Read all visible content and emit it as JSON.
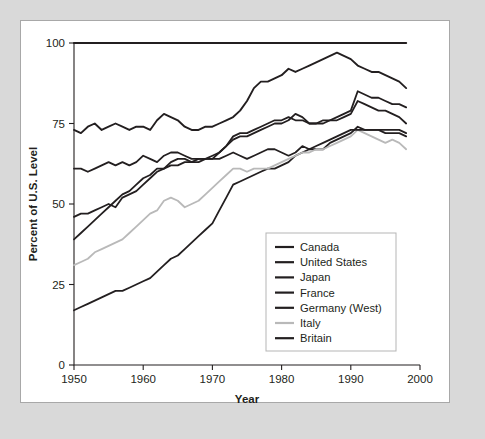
{
  "figure": {
    "background_color": "#d9d9d9",
    "card_color": "#ffffff",
    "card_border_color": "#a8a8a8"
  },
  "chart_data": {
    "type": "line",
    "title": "",
    "xlabel": "Year",
    "ylabel": "Percent of U.S. Level",
    "xlim": [
      1950,
      2000
    ],
    "ylim": [
      0,
      100
    ],
    "xticks": [
      1950,
      1960,
      1970,
      1980,
      1990,
      2000
    ],
    "yticks": [
      0,
      25,
      50,
      75,
      100
    ],
    "grid": false,
    "legend_position": "inside-lower-right",
    "x": [
      1950,
      1951,
      1952,
      1953,
      1954,
      1955,
      1956,
      1957,
      1958,
      1959,
      1960,
      1961,
      1962,
      1963,
      1964,
      1965,
      1966,
      1967,
      1968,
      1969,
      1970,
      1971,
      1972,
      1973,
      1974,
      1975,
      1976,
      1977,
      1978,
      1979,
      1980,
      1981,
      1982,
      1983,
      1984,
      1985,
      1986,
      1987,
      1988,
      1989,
      1990,
      1991,
      1992,
      1993,
      1994,
      1995,
      1996,
      1997,
      1998
    ],
    "series": [
      {
        "name": "Canada",
        "color": "#231f20",
        "width": 1.9,
        "values": [
          73,
          72,
          74,
          75,
          73,
          74,
          75,
          74,
          73,
          74,
          74,
          73,
          76,
          78,
          77,
          76,
          74,
          73,
          73,
          74,
          74,
          75,
          76,
          77,
          79,
          82,
          86,
          88,
          88,
          89,
          90,
          92,
          91,
          92,
          93,
          94,
          95,
          96,
          97,
          96,
          95,
          93,
          92,
          91,
          91,
          90,
          89,
          88,
          86
        ]
      },
      {
        "name": "United States",
        "color": "#231f20",
        "width": 2.1,
        "values": [
          100,
          100,
          100,
          100,
          100,
          100,
          100,
          100,
          100,
          100,
          100,
          100,
          100,
          100,
          100,
          100,
          100,
          100,
          100,
          100,
          100,
          100,
          100,
          100,
          100,
          100,
          100,
          100,
          100,
          100,
          100,
          100,
          100,
          100,
          100,
          100,
          100,
          100,
          100,
          100,
          100,
          100,
          100,
          100,
          100,
          100,
          100,
          100,
          100
        ]
      },
      {
        "name": "Japan",
        "color": "#231f20",
        "width": 1.8,
        "values": [
          17,
          18,
          19,
          20,
          21,
          22,
          23,
          23,
          24,
          25,
          26,
          27,
          29,
          31,
          33,
          34,
          36,
          38,
          40,
          42,
          44,
          48,
          52,
          56,
          57,
          58,
          59,
          60,
          61,
          61,
          62,
          63,
          65,
          66,
          67,
          67,
          67,
          69,
          70,
          71,
          72,
          74,
          73,
          73,
          73,
          72,
          72,
          72,
          71
        ]
      },
      {
        "name": "France",
        "color": "#231f20",
        "width": 1.8,
        "values": [
          46,
          47,
          47,
          48,
          49,
          50,
          49,
          52,
          53,
          54,
          56,
          58,
          60,
          61,
          62,
          62,
          63,
          63,
          64,
          64,
          65,
          66,
          68,
          70,
          71,
          71,
          72,
          73,
          74,
          75,
          75,
          76,
          78,
          77,
          75,
          75,
          76,
          76,
          76,
          77,
          78,
          82,
          81,
          80,
          79,
          79,
          78,
          77,
          75
        ]
      },
      {
        "name": "Germany (West)",
        "color": "#231f20",
        "width": 1.8,
        "values": [
          39,
          41,
          43,
          45,
          47,
          49,
          51,
          53,
          54,
          56,
          58,
          59,
          61,
          61,
          63,
          64,
          64,
          63,
          63,
          64,
          64,
          66,
          68,
          71,
          72,
          72,
          73,
          74,
          75,
          76,
          76,
          77,
          76,
          76,
          75,
          75,
          75,
          76,
          77,
          78,
          79,
          85,
          84,
          83,
          83,
          82,
          81,
          81,
          80
        ]
      },
      {
        "name": "Italy",
        "color": "#b9b9b9",
        "width": 1.8,
        "values": [
          31,
          32,
          33,
          35,
          36,
          37,
          38,
          39,
          41,
          43,
          45,
          47,
          48,
          51,
          52,
          51,
          49,
          50,
          51,
          53,
          55,
          57,
          59,
          61,
          61,
          60,
          61,
          61,
          61,
          62,
          63,
          64,
          65,
          66,
          66,
          67,
          67,
          68,
          69,
          70,
          71,
          73,
          72,
          71,
          70,
          69,
          70,
          69,
          67
        ]
      },
      {
        "name": "Britain",
        "color": "#231f20",
        "width": 1.8,
        "values": [
          61,
          61,
          60,
          61,
          62,
          63,
          62,
          63,
          62,
          63,
          65,
          64,
          63,
          65,
          66,
          66,
          65,
          64,
          64,
          64,
          64,
          64,
          65,
          66,
          65,
          64,
          65,
          66,
          67,
          67,
          66,
          65,
          66,
          68,
          67,
          68,
          69,
          70,
          71,
          72,
          73,
          73,
          73,
          73,
          73,
          73,
          73,
          73,
          72
        ]
      }
    ]
  }
}
